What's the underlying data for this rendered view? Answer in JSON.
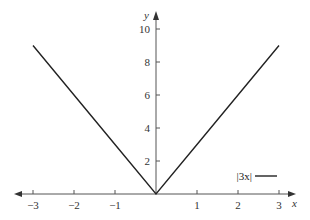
{
  "chart_data": {
    "type": "line",
    "title": "",
    "xlabel": "x",
    "ylabel": "y",
    "xlim": [
      -3.3,
      3.3
    ],
    "ylim": [
      0,
      10.5
    ],
    "grid": false,
    "legend_position": "lower right",
    "x_ticks": [
      -3,
      -2,
      -1,
      1,
      2,
      3
    ],
    "x_tick_labels": [
      "−3",
      "−2",
      "−1",
      "1",
      "2",
      "3"
    ],
    "y_ticks": [
      2,
      4,
      6,
      8,
      10
    ],
    "y_tick_labels": [
      "2",
      "4",
      "6",
      "8",
      "10"
    ],
    "series": [
      {
        "name": "|3x|",
        "color": "#222222",
        "x": [
          -3,
          -2,
          -1,
          0,
          1,
          2,
          3
        ],
        "y": [
          9,
          6,
          3,
          0,
          3,
          6,
          9
        ]
      }
    ]
  },
  "legend": {
    "label": "|3x|"
  },
  "axes": {
    "x_label": "x",
    "y_label": "y"
  }
}
